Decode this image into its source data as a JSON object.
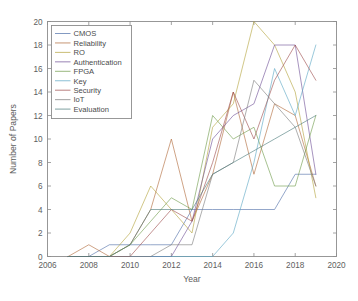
{
  "chart_data": {
    "type": "line",
    "title": "",
    "xlabel": "Year",
    "ylabel": "Number of Papers",
    "xlim": [
      2006,
      2020
    ],
    "ylim": [
      0,
      20
    ],
    "xticks": [
      2006,
      2008,
      2010,
      2012,
      2014,
      2016,
      2018,
      2020
    ],
    "yticks": [
      0,
      2,
      4,
      6,
      8,
      10,
      12,
      14,
      16,
      18,
      20
    ],
    "grid": false,
    "legend_position": "upper-left",
    "x": [
      2007,
      2008,
      2009,
      2010,
      2011,
      2012,
      2013,
      2014,
      2015,
      2016,
      2017,
      2018,
      2019
    ],
    "series": [
      {
        "name": "CMOS",
        "color": "#4f6fa8",
        "values": [
          0,
          0,
          1,
          1,
          1,
          1,
          4,
          4,
          4,
          4,
          4,
          7,
          7
        ]
      },
      {
        "name": "Reliability",
        "color": "#b06a3a",
        "values": [
          0,
          1,
          0,
          1,
          4,
          10,
          3,
          7,
          14,
          7,
          13,
          12,
          6
        ]
      },
      {
        "name": "RO",
        "color": "#b3a33c",
        "values": [
          0,
          0,
          0,
          2,
          6,
          4,
          2,
          11,
          13,
          20,
          18,
          14,
          5
        ]
      },
      {
        "name": "Authentication",
        "color": "#6f4f96",
        "values": [
          0,
          0,
          0,
          0,
          0,
          0,
          3,
          10,
          12,
          13,
          18,
          18,
          7
        ]
      },
      {
        "name": "FPGA",
        "color": "#6f9b4a",
        "values": [
          0,
          0,
          0,
          1,
          3,
          5,
          4,
          12,
          10,
          11,
          6,
          6,
          12
        ]
      },
      {
        "name": "Key",
        "color": "#5aa6c4",
        "values": [
          0,
          0,
          0,
          0,
          0,
          0,
          0,
          0,
          2,
          8,
          16,
          12,
          18
        ]
      },
      {
        "name": "Security",
        "color": "#9d4b4b",
        "values": [
          0,
          0,
          0,
          0,
          2,
          4,
          3,
          8,
          14,
          10,
          15,
          18,
          15
        ]
      },
      {
        "name": "IoT",
        "color": "#7b7b7b",
        "values": [
          0,
          0,
          0,
          0,
          0,
          1,
          1,
          7,
          8,
          15,
          13,
          11,
          6
        ]
      },
      {
        "name": "Evaluation",
        "color": "#4a7a7a",
        "values": [
          0,
          0,
          0,
          1,
          4,
          4,
          4,
          7,
          8,
          9,
          10,
          11,
          12
        ]
      }
    ]
  }
}
